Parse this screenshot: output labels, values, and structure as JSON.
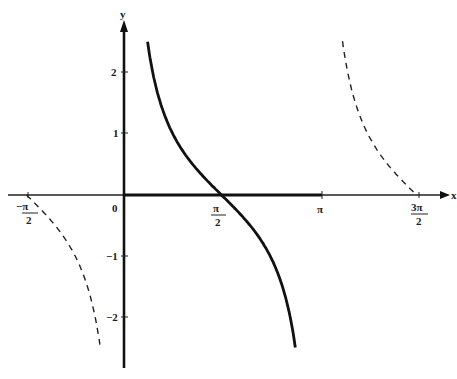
{
  "chart_data": {
    "type": "line",
    "title": "",
    "xlabel": "x",
    "ylabel": "y",
    "xlim": [
      -1.65,
      5.0
    ],
    "ylim": [
      -2.6,
      2.6
    ],
    "grid": false,
    "x_ticks": [
      "-π/2",
      "π/2",
      "π",
      "3π/2"
    ],
    "y_ticks": [
      "2",
      "1",
      "-1",
      "-2"
    ],
    "origin_label": "0",
    "series": [
      {
        "name": "cot x (principal branch)",
        "style": "solid",
        "x_range": [
          0.38,
          2.76
        ],
        "function": "cot"
      },
      {
        "name": "cot x (left branch)",
        "style": "dashed",
        "x_range": [
          -1.5708,
          -0.38
        ],
        "function": "cot"
      },
      {
        "name": "cot x (right branch)",
        "style": "dashed",
        "x_range": [
          3.52,
          4.7124
        ],
        "function": "cot"
      }
    ],
    "highlight": {
      "name": "x-axis segment 0 to π",
      "style": "bold",
      "x_range": [
        0,
        3.1416
      ]
    }
  },
  "labels": {
    "x_axis": "x",
    "y_axis": "y",
    "origin": "0",
    "y2": "2",
    "y1": "1",
    "ym1": "−1",
    "ym2": "−2",
    "pi": "π",
    "pi_num": "π",
    "two": "2",
    "three_pi": "3π",
    "neg_pi": "−π"
  }
}
